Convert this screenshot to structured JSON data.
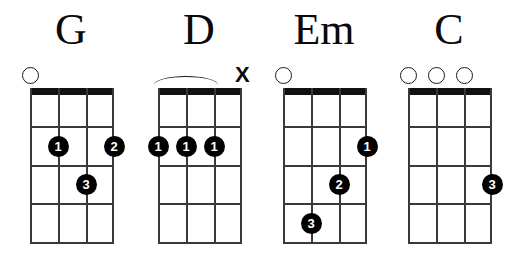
{
  "page": {
    "background_color": "#ffffff",
    "ink_color": "#111111",
    "dot_color": "#000000",
    "dot_text_color": "#ffffff"
  },
  "diagram_spec": {
    "strings": 4,
    "frets": 4,
    "string_labels": [
      "1",
      "2",
      "3",
      "4"
    ],
    "fret_labels": [
      "1",
      "2",
      "3",
      "4"
    ]
  },
  "chords": [
    {
      "name": "G",
      "left": 6,
      "grid": {
        "left": 30,
        "top": 88,
        "width": 84,
        "height": 155
      },
      "markers": [
        {
          "type": "open",
          "string": 1,
          "label": "O"
        }
      ],
      "barre": null,
      "dots": [
        {
          "finger": "1",
          "string": 2,
          "fret": 2
        },
        {
          "finger": "2",
          "string": 4,
          "fret": 2
        },
        {
          "finger": "3",
          "string": 3,
          "fret": 3
        }
      ]
    },
    {
      "name": "D",
      "left": 134,
      "grid": {
        "left": 158,
        "top": 88,
        "width": 84,
        "height": 155
      },
      "markers": [
        {
          "type": "mute",
          "string": 4,
          "label": "X"
        }
      ],
      "barre": {
        "from_string": 1,
        "to_string": 3
      },
      "dots": [
        {
          "finger": "1",
          "string": 1,
          "fret": 2
        },
        {
          "finger": "1",
          "string": 2,
          "fret": 2
        },
        {
          "finger": "1",
          "string": 3,
          "fret": 2
        }
      ]
    },
    {
      "name": "Em",
      "left": 259,
      "grid": {
        "left": 283,
        "top": 88,
        "width": 84,
        "height": 155
      },
      "markers": [
        {
          "type": "open",
          "string": 1,
          "label": "O"
        }
      ],
      "barre": null,
      "dots": [
        {
          "finger": "1",
          "string": 4,
          "fret": 2
        },
        {
          "finger": "2",
          "string": 3,
          "fret": 3
        },
        {
          "finger": "3",
          "string": 2,
          "fret": 4
        }
      ]
    },
    {
      "name": "C",
      "left": 384,
      "grid": {
        "left": 408,
        "top": 88,
        "width": 84,
        "height": 155
      },
      "markers": [
        {
          "type": "open",
          "string": 1,
          "label": "O"
        },
        {
          "type": "open",
          "string": 2,
          "label": "O"
        },
        {
          "type": "open",
          "string": 3,
          "label": "O"
        }
      ],
      "barre": null,
      "dots": [
        {
          "finger": "3",
          "string": 4,
          "fret": 3
        }
      ]
    }
  ]
}
